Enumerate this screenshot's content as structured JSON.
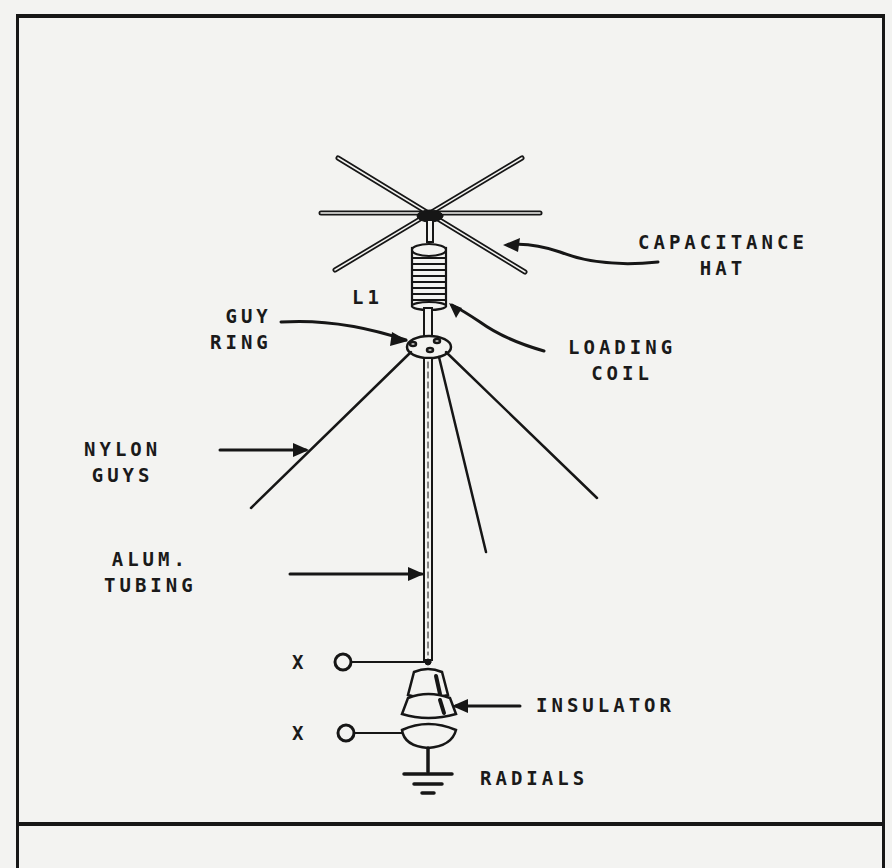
{
  "diagram": {
    "type": "vertical antenna construction illustration",
    "labels": {
      "capacitance_hat": [
        "CAPACITANCE",
        "HAT"
      ],
      "l1": "L1",
      "guy_ring": [
        "GUY",
        "RING"
      ],
      "loading_coil": [
        "LOADING",
        "COIL"
      ],
      "nylon_guys": [
        "NYLON",
        "GUYS"
      ],
      "alum_tubing": [
        "ALUM.",
        "TUBING"
      ],
      "x_top": "X",
      "x_bottom": "X",
      "insulator": "INSULATOR",
      "radials": "RADIALS"
    },
    "components": [
      "capacitance-hat",
      "loading-coil",
      "guy-ring",
      "nylon-guys",
      "aluminum-tubing",
      "feed-terminals",
      "insulator",
      "ground-radials"
    ],
    "colors": {
      "ink": "#161616",
      "paper": "#f3f3f1"
    }
  }
}
